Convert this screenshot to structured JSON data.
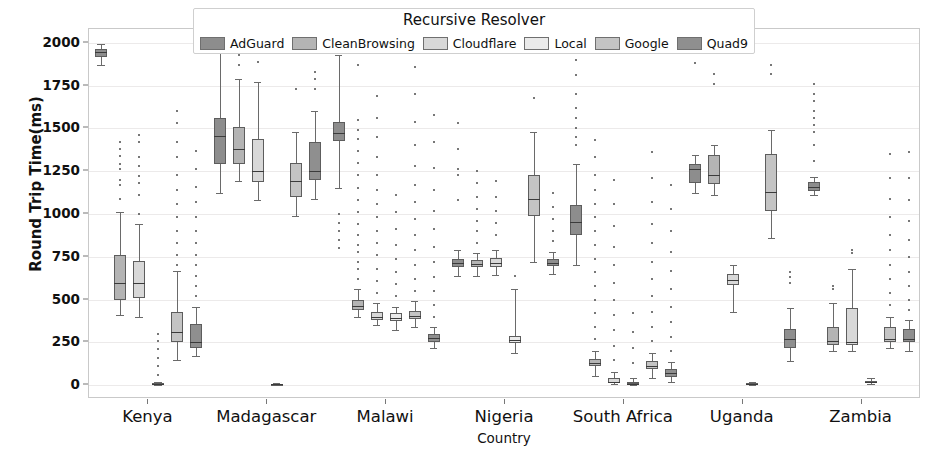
{
  "legend": {
    "title": "Recursive Resolver",
    "items": [
      {
        "label": "AdGuard",
        "color": "#8d8d8d"
      },
      {
        "label": "CleanBrowsing",
        "color": "#b4b4b4"
      },
      {
        "label": "Cloudflare",
        "color": "#d8d8d8"
      },
      {
        "label": "Local",
        "color": "#eaeaea"
      },
      {
        "label": "Google",
        "color": "#c4c4c4"
      },
      {
        "label": "Quad9",
        "color": "#8f8f8f"
      }
    ]
  },
  "chart_data": {
    "type": "box",
    "title": "Recursive Resolver",
    "xlabel": "Country",
    "ylabel": "Round Trip Time(ms)",
    "ylim": [
      -80,
      2080
    ],
    "yticks": [
      0,
      250,
      500,
      750,
      1000,
      1250,
      1500,
      1750,
      2000
    ],
    "grid": true,
    "legend_position": "upper center",
    "categories": [
      "Kenya",
      "Madagascar",
      "Malawi",
      "Nigeria",
      "South Africa",
      "Uganda",
      "Zambia"
    ],
    "series": [
      {
        "name": "AdGuard",
        "color": "#8d8d8d",
        "boxes": [
          {
            "category": "Kenya",
            "whislo": 1870,
            "q1": 1915,
            "med": 1945,
            "q3": 1965,
            "whishi": 1990,
            "fliers": []
          },
          {
            "category": "Madagascar",
            "whislo": 1120,
            "q1": 1290,
            "med": 1455,
            "q3": 1560,
            "whishi": 2020,
            "fliers": []
          },
          {
            "category": "Malawi",
            "whislo": 1150,
            "q1": 1425,
            "med": 1475,
            "q3": 1535,
            "whishi": 1930,
            "fliers": [
              800,
              850,
              900,
              950,
              1000,
              1950,
              1985
            ]
          },
          {
            "category": "Nigeria",
            "whislo": 640,
            "q1": 690,
            "med": 715,
            "q3": 735,
            "whishi": 790,
            "fliers": [
              1080,
              1230,
              1260,
              1380,
              1530
            ]
          },
          {
            "category": "South Africa",
            "whislo": 700,
            "q1": 880,
            "med": 955,
            "q3": 1055,
            "whishi": 1290,
            "fliers": [
              1400,
              1450,
              1500,
              1560,
              1620,
              1700,
              1810,
              1900,
              1990
            ]
          },
          {
            "category": "Uganda",
            "whislo": 1120,
            "q1": 1180,
            "med": 1260,
            "q3": 1290,
            "whishi": 1345,
            "fliers": [
              1880
            ]
          },
          {
            "category": "Zambia",
            "whislo": 1110,
            "q1": 1135,
            "med": 1160,
            "q3": 1185,
            "whishi": 1215,
            "fliers": [
              1310,
              1400,
              1480,
              1520,
              1560,
              1600,
              1660,
              1700,
              1760
            ]
          }
        ]
      },
      {
        "name": "CleanBrowsing",
        "color": "#b4b4b4",
        "boxes": [
          {
            "category": "Kenya",
            "whislo": 410,
            "q1": 500,
            "med": 595,
            "q3": 760,
            "whishi": 1010,
            "fliers": [
              1090,
              1170,
              1200,
              1260,
              1290,
              1340,
              1380,
              1420
            ]
          },
          {
            "category": "Madagascar",
            "whislo": 1190,
            "q1": 1290,
            "med": 1380,
            "q3": 1510,
            "whishi": 1790,
            "fliers": [
              1870,
              1930
            ]
          },
          {
            "category": "Malawi",
            "whislo": 400,
            "q1": 440,
            "med": 465,
            "q3": 500,
            "whishi": 560,
            "fliers": [
              620,
              680,
              720,
              780,
              820,
              880,
              940,
              1010,
              1080,
              1150,
              1230,
              1300,
              1370,
              1440,
              1490,
              1550,
              1870
            ]
          },
          {
            "category": "Nigeria",
            "whislo": 640,
            "q1": 690,
            "med": 710,
            "q3": 730,
            "whishi": 770,
            "fliers": [
              830,
              900,
              960,
              1030,
              1100,
              1180,
              1250
            ]
          },
          {
            "category": "South Africa",
            "whislo": 55,
            "q1": 110,
            "med": 130,
            "q3": 155,
            "whishi": 200,
            "fliers": [
              270,
              340,
              420,
              500,
              580,
              660,
              740,
              820,
              900,
              980,
              1060,
              1140,
              1230,
              1330,
              1430
            ]
          },
          {
            "category": "Uganda",
            "whislo": 1110,
            "q1": 1175,
            "med": 1225,
            "q3": 1345,
            "whishi": 1405,
            "fliers": [
              1760,
              1820
            ]
          },
          {
            "category": "Zambia",
            "whislo": 200,
            "q1": 235,
            "med": 260,
            "q3": 340,
            "whishi": 480,
            "fliers": [
              560,
              580
            ]
          }
        ]
      },
      {
        "name": "Cloudflare",
        "color": "#d8d8d8",
        "boxes": [
          {
            "category": "Kenya",
            "whislo": 400,
            "q1": 510,
            "med": 600,
            "q3": 725,
            "whishi": 940,
            "fliers": [
              1000,
              1110,
              1180,
              1220,
              1280,
              1330,
              1420,
              1460
            ]
          },
          {
            "category": "Madagascar",
            "whislo": 1080,
            "q1": 1185,
            "med": 1250,
            "q3": 1440,
            "whishi": 1770,
            "fliers": [
              1890
            ]
          },
          {
            "category": "Malawi",
            "whislo": 350,
            "q1": 380,
            "med": 400,
            "q3": 430,
            "whishi": 480,
            "fliers": [
              540,
              610,
              680,
              760,
              830,
              900,
              980,
              1060,
              1140,
              1230,
              1330,
              1450,
              1560,
              1690
            ]
          },
          {
            "category": "Nigeria",
            "whislo": 645,
            "q1": 690,
            "med": 715,
            "q3": 745,
            "whishi": 790,
            "fliers": [
              880,
              950,
              1020,
              1100,
              1190
            ]
          },
          {
            "category": "South Africa",
            "whislo": 8,
            "q1": 15,
            "med": 22,
            "q3": 40,
            "whishi": 75,
            "fliers": [
              150,
              230,
              320,
              410,
              500,
              600,
              700,
              810,
              930,
              1060,
              1200
            ]
          },
          {
            "category": "Uganda",
            "whislo": 430,
            "q1": 585,
            "med": 615,
            "q3": 650,
            "whishi": 700,
            "fliers": []
          },
          {
            "category": "Zambia",
            "whislo": 200,
            "q1": 235,
            "med": 255,
            "q3": 450,
            "whishi": 680,
            "fliers": [
              770,
              790
            ]
          }
        ]
      },
      {
        "name": "Local",
        "color": "#eaeaea",
        "boxes": [
          {
            "category": "Kenya",
            "whislo": 3,
            "q1": 6,
            "med": 9,
            "q3": 13,
            "whishi": 20,
            "fliers": [
              60,
              110,
              160,
              210,
              260,
              300
            ]
          },
          {
            "category": "Madagascar",
            "whislo": 2,
            "q1": 4,
            "med": 6,
            "q3": 9,
            "whishi": 14,
            "fliers": []
          },
          {
            "category": "Malawi",
            "whislo": 320,
            "q1": 375,
            "med": 395,
            "q3": 420,
            "whishi": 460,
            "fliers": [
              520,
              590,
              660,
              740,
              820,
              910,
              1010,
              1110
            ]
          },
          {
            "category": "Nigeria",
            "whislo": 190,
            "q1": 245,
            "med": 265,
            "q3": 290,
            "whishi": 560,
            "fliers": [
              640
            ]
          },
          {
            "category": "South Africa",
            "whislo": 2,
            "q1": 6,
            "med": 10,
            "q3": 18,
            "whishi": 40,
            "fliers": [
              130,
              220,
              310,
              420
            ]
          },
          {
            "category": "Uganda",
            "whislo": 3,
            "q1": 6,
            "med": 9,
            "q3": 13,
            "whishi": 20,
            "fliers": []
          },
          {
            "category": "Zambia",
            "whislo": 6,
            "q1": 12,
            "med": 18,
            "q3": 26,
            "whishi": 40,
            "fliers": []
          }
        ]
      },
      {
        "name": "Google",
        "color": "#c4c4c4",
        "boxes": [
          {
            "category": "Kenya",
            "whislo": 150,
            "q1": 250,
            "med": 310,
            "q3": 430,
            "whishi": 665,
            "fliers": [
              700,
              760,
              830,
              900,
              980,
              1060,
              1140,
              1230,
              1330,
              1420,
              1530,
              1600
            ]
          },
          {
            "category": "Madagascar",
            "whislo": 990,
            "q1": 1100,
            "med": 1190,
            "q3": 1300,
            "whishi": 1480,
            "fliers": [
              1730
            ]
          },
          {
            "category": "Malawi",
            "whislo": 340,
            "q1": 385,
            "med": 405,
            "q3": 435,
            "whishi": 490,
            "fliers": [
              550,
              620,
              700,
              790,
              880,
              970,
              1070,
              1170,
              1280,
              1400,
              1540,
              1700,
              1860
            ]
          },
          {
            "category": "Nigeria",
            "whislo": 720,
            "q1": 990,
            "med": 1090,
            "q3": 1230,
            "whishi": 1480,
            "fliers": [
              1680
            ]
          },
          {
            "category": "South Africa",
            "whislo": 45,
            "q1": 95,
            "med": 115,
            "q3": 140,
            "whishi": 190,
            "fliers": [
              260,
              340,
              430,
              520,
              620,
              720,
              830,
              940,
              1070,
              1210,
              1360
            ]
          },
          {
            "category": "Uganda",
            "whislo": 860,
            "q1": 1020,
            "med": 1130,
            "q3": 1350,
            "whishi": 1490,
            "fliers": [
              1820,
              1870
            ]
          },
          {
            "category": "Zambia",
            "whislo": 215,
            "q1": 250,
            "med": 270,
            "q3": 340,
            "whishi": 400,
            "fliers": [
              470,
              540,
              620,
              700,
              790,
              880,
              980,
              1090,
              1210,
              1350
            ]
          }
        ]
      },
      {
        "name": "Quad9",
        "color": "#8f8f8f",
        "boxes": [
          {
            "category": "Kenya",
            "whislo": 170,
            "q1": 215,
            "med": 250,
            "q3": 360,
            "whishi": 460,
            "fliers": [
              520,
              580,
              640,
              700,
              760,
              830,
              900,
              980,
              1070,
              1160,
              1260,
              1370
            ]
          },
          {
            "category": "Madagascar",
            "whislo": 1090,
            "q1": 1200,
            "med": 1250,
            "q3": 1420,
            "whishi": 1600,
            "fliers": [
              1730,
              1790,
              1830
            ]
          },
          {
            "category": "Malawi",
            "whislo": 215,
            "q1": 255,
            "med": 275,
            "q3": 300,
            "whishi": 340,
            "fliers": [
              400,
              470,
              550,
              630,
              720,
              810,
              910,
              1020,
              1140,
              1270,
              1420,
              1580
            ]
          },
          {
            "category": "Nigeria",
            "whislo": 650,
            "q1": 695,
            "med": 715,
            "q3": 740,
            "whishi": 780,
            "fliers": [
              840,
              900,
              970,
              1040,
              1120
            ]
          },
          {
            "category": "South Africa",
            "whislo": 20,
            "q1": 50,
            "med": 70,
            "q3": 95,
            "whishi": 135,
            "fliers": [
              200,
              280,
              370,
              460,
              560,
              670,
              780,
              900,
              1030,
              1170
            ]
          },
          {
            "category": "Uganda",
            "whislo": 140,
            "q1": 220,
            "med": 270,
            "q3": 330,
            "whishi": 450,
            "fliers": [
              600,
              630,
              660
            ]
          },
          {
            "category": "Zambia",
            "whislo": 200,
            "q1": 250,
            "med": 270,
            "q3": 330,
            "whishi": 380,
            "fliers": [
              440,
              500,
              580,
              660,
              750,
              850,
              960,
              1080,
              1210,
              1360
            ]
          }
        ]
      }
    ]
  }
}
